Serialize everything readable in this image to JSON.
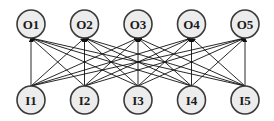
{
  "diagram": {
    "type": "bipartite-network",
    "outputs": [
      {
        "id": "O1",
        "label": "O1"
      },
      {
        "id": "O2",
        "label": "O2"
      },
      {
        "id": "O3",
        "label": "O3"
      },
      {
        "id": "O4",
        "label": "O4"
      },
      {
        "id": "O5",
        "label": "O5"
      }
    ],
    "inputs": [
      {
        "id": "I1",
        "label": "I1"
      },
      {
        "id": "I2",
        "label": "I2"
      },
      {
        "id": "I3",
        "label": "I3"
      },
      {
        "id": "I4",
        "label": "I4"
      },
      {
        "id": "I5",
        "label": "I5"
      }
    ],
    "connectivity": "all-inputs-to-all-outputs",
    "edge_direction": "input-to-output",
    "colors": {
      "node_fill": "#ececec",
      "node_stroke": "#3a3a3a",
      "edge": "#111111"
    }
  }
}
